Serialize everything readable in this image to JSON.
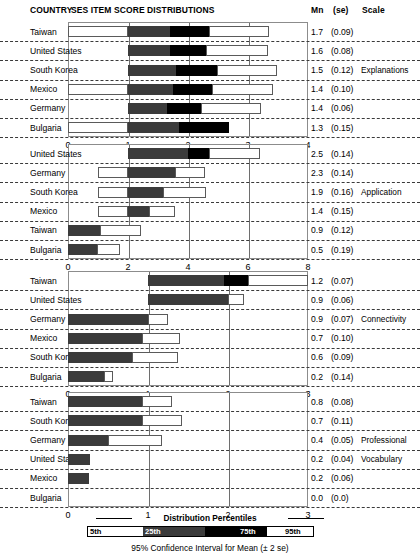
{
  "header": {
    "country": "COUNTRY",
    "distributions": "SES ITEM SCORE DISTRIBUTIONS",
    "mn": "Mn",
    "se": "(se)",
    "scale": "Scale"
  },
  "legend": {
    "title": "Distribution Percentiles",
    "p5": "5th",
    "p25": "25th",
    "p75": "75th",
    "p95": "95th",
    "footnote": "95% Confidence Interval for Mean (± 2 se)"
  },
  "chart_data": {
    "type": "bar",
    "title": "SES ITEM SCORE DISTRIBUTIONS",
    "xlabel": "",
    "ylabel": "",
    "grid": true,
    "legend_position": "bottom",
    "panels": [
      {
        "scale": "Explanations",
        "xlim": [
          0,
          4
        ],
        "xticks": [
          0,
          1,
          2,
          3,
          4
        ],
        "rows": [
          {
            "country": "Taiwan",
            "mn": "1.7",
            "se": "(0.09)",
            "p5": 0.0,
            "p25": 1.0,
            "p50": 1.7,
            "p75": 2.35,
            "p95": 3.35
          },
          {
            "country": "United States",
            "mn": "1.6",
            "se": "(0.08)",
            "p5": 1.0,
            "p25": 1.0,
            "p50": 1.7,
            "p75": 2.3,
            "p95": 3.33
          },
          {
            "country": "South Korea",
            "mn": "1.5",
            "se": "(0.12)",
            "p5": 1.0,
            "p25": 1.0,
            "p50": 1.8,
            "p75": 2.48,
            "p95": 3.48
          },
          {
            "country": "Mexico",
            "mn": "1.4",
            "se": "(0.10)",
            "p5": 0.0,
            "p25": 1.0,
            "p50": 1.75,
            "p75": 2.4,
            "p95": 3.42
          },
          {
            "country": "Germany",
            "mn": "1.4",
            "se": "(0.06)",
            "p5": 1.0,
            "p25": 1.0,
            "p50": 1.65,
            "p75": 2.22,
            "p95": 3.22
          },
          {
            "country": "Bulgaria",
            "mn": "1.3",
            "se": "(0.15)",
            "p5": 0.0,
            "p25": 1.0,
            "p50": 1.85,
            "p75": 2.68,
            "p95": 2.68
          }
        ]
      },
      {
        "scale": "Application",
        "xlim": [
          0,
          8
        ],
        "xticks": [
          0,
          2,
          4,
          6,
          8
        ],
        "rows": [
          {
            "country": "United States",
            "mn": "2.5",
            "se": "(0.14)",
            "p5": 2.0,
            "p25": 2.0,
            "p50": 4.0,
            "p75": 4.7,
            "p95": 6.4
          },
          {
            "country": "Germany",
            "mn": "2.3",
            "se": "(0.14)",
            "p5": 1.0,
            "p25": 2.0,
            "p50": 3.55,
            "p75": 3.55,
            "p95": 4.55
          },
          {
            "country": "South Korea",
            "mn": "1.9",
            "se": "(0.16)",
            "p5": 1.0,
            "p25": 2.0,
            "p50": 3.15,
            "p75": 3.15,
            "p95": 4.6
          },
          {
            "country": "Mexico",
            "mn": "1.4",
            "se": "(0.15)",
            "p5": 1.0,
            "p25": 2.0,
            "p50": 2.7,
            "p75": 2.7,
            "p95": 3.55
          },
          {
            "country": "Taiwan",
            "mn": "0.9",
            "se": "(0.12)",
            "p5": 0.0,
            "p25": 0.0,
            "p50": 1.05,
            "p75": 1.05,
            "p95": 2.42
          },
          {
            "country": "Bulgaria",
            "mn": "0.5",
            "se": "(0.19)",
            "p5": 0.0,
            "p25": 0.0,
            "p50": 0.95,
            "p75": 0.95,
            "p95": 1.72
          }
        ]
      },
      {
        "scale": "Connectivity",
        "xlim": [
          0,
          3
        ],
        "xticks": [
          0,
          1,
          2,
          3
        ],
        "rows": [
          {
            "country": "Taiwan",
            "mn": "1.2",
            "se": "(0.07)",
            "p5": 1.0,
            "p25": 1.0,
            "p50": 1.95,
            "p75": 2.25,
            "p95": 3.0
          },
          {
            "country": "United States",
            "mn": "0.9",
            "se": "(0.06)",
            "p5": 1.0,
            "p25": 1.0,
            "p50": 2.0,
            "p75": 2.0,
            "p95": 2.2
          },
          {
            "country": "Germany",
            "mn": "0.9",
            "se": "(0.07)",
            "p5": 0.0,
            "p25": 0.0,
            "p50": 1.0,
            "p75": 1.0,
            "p95": 1.25
          },
          {
            "country": "Mexico",
            "mn": "0.7",
            "se": "(0.10)",
            "p5": 0.0,
            "p25": 0.0,
            "p50": 0.92,
            "p75": 0.92,
            "p95": 1.4
          },
          {
            "country": "South Korea",
            "mn": "0.6",
            "se": "(0.09)",
            "p5": 0.0,
            "p25": 0.0,
            "p50": 0.8,
            "p75": 0.8,
            "p95": 1.38
          },
          {
            "country": "Bulgaria",
            "mn": "0.2",
            "se": "(0.14)",
            "p5": 0.0,
            "p25": 0.0,
            "p50": 0.45,
            "p75": 0.45,
            "p95": 0.56
          }
        ]
      },
      {
        "scale": "Professional\nVocabulary",
        "scale_line1": "Professional",
        "scale_line2": "Vocabulary",
        "xlim": [
          0,
          3
        ],
        "xticks": [
          0,
          1,
          2,
          3
        ],
        "rows": [
          {
            "country": "Taiwan",
            "mn": "0.8",
            "se": "(0.08)",
            "p5": 0.0,
            "p25": 0.0,
            "p50": 0.93,
            "p75": 0.93,
            "p95": 1.3
          },
          {
            "country": "South Korea",
            "mn": "0.7",
            "se": "(0.11)",
            "p5": 0.0,
            "p25": 0.0,
            "p50": 0.92,
            "p75": 0.92,
            "p95": 1.42
          },
          {
            "country": "Germany",
            "mn": "0.4",
            "se": "(0.05)",
            "p5": 0.0,
            "p25": 0.0,
            "p50": 0.5,
            "p75": 0.5,
            "p95": 1.17
          },
          {
            "country": "United States",
            "mn": "0.2",
            "se": "(0.04)",
            "p5": 0.0,
            "p25": 0.0,
            "p50": 0.28,
            "p75": 0.28,
            "p95": 0.28
          },
          {
            "country": "Mexico",
            "mn": "0.2",
            "se": "(0.06)",
            "p5": 0.0,
            "p25": 0.0,
            "p50": 0.26,
            "p75": 0.26,
            "p95": 0.26
          },
          {
            "country": "Bulgaria",
            "mn": "0.0",
            "se": "(0.0)",
            "p5": 0.0,
            "p25": 0.0,
            "p50": 0.0,
            "p75": 0.0,
            "p95": 0.0
          }
        ]
      }
    ]
  }
}
